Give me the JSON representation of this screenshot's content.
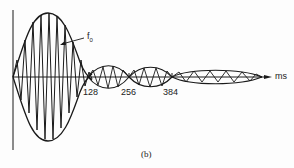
{
  "figure": {
    "caption": "(b)",
    "signal_label": "f",
    "signal_label_sub": "0",
    "axis_unit": "ms",
    "ticks": [
      {
        "label": "128",
        "x": 88
      },
      {
        "label": "256",
        "x": 129
      },
      {
        "label": "384",
        "x": 172
      }
    ]
  },
  "colors": {
    "ink": "#1a1a1a",
    "background": "#fdfdfd"
  }
}
